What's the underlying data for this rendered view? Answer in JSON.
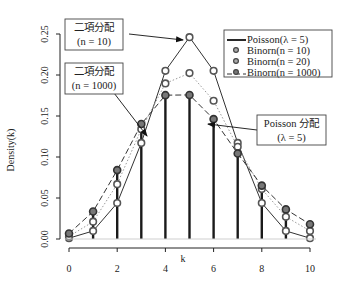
{
  "chart_data": {
    "type": "line",
    "title": "",
    "xlabel": "k",
    "ylabel": "Density(k)",
    "xlim": [
      0,
      10
    ],
    "ylim": [
      0,
      0.25
    ],
    "x_ticks": [
      "0",
      "2",
      "4",
      "6",
      "8",
      "10"
    ],
    "y_ticks": [
      "0.00",
      "0.05",
      "0.10",
      "0.15",
      "0.20",
      "0.25"
    ],
    "grid": false,
    "legend_position": "top-right",
    "x": [
      0,
      1,
      2,
      3,
      4,
      5,
      6,
      7,
      8,
      9,
      10
    ],
    "series": [
      {
        "name": "Poisson(λ = 5)",
        "style": "vertical bars (thick lines)",
        "values": [
          0.0067,
          0.0337,
          0.0842,
          0.1404,
          0.1755,
          0.1755,
          0.1462,
          0.1044,
          0.0653,
          0.0363,
          0.0181
        ]
      },
      {
        "name": "Binorn(n = 10)",
        "style": "points + solid line",
        "values": [
          0.001,
          0.0098,
          0.0439,
          0.1172,
          0.2051,
          0.2461,
          0.2051,
          0.1172,
          0.0439,
          0.0098,
          0.001
        ]
      },
      {
        "name": "Binorn(n = 20)",
        "style": "points + dotted line",
        "values": [
          0.0032,
          0.0211,
          0.0669,
          0.1339,
          0.1897,
          0.2023,
          0.1686,
          0.1124,
          0.0609,
          0.0271,
          0.0099
        ]
      },
      {
        "name": "Binorn(n = 1000)",
        "style": "points + dashed line",
        "values": [
          0.0067,
          0.0335,
          0.084,
          0.1402,
          0.1754,
          0.1757,
          0.1462,
          0.1043,
          0.0651,
          0.0361,
          0.018
        ]
      }
    ],
    "legend": [
      "Poisson(λ = 5)",
      "Binorn(n = 10)",
      "Binorn(n = 20)",
      "Binorn(n = 1000)"
    ],
    "annotations": [
      {
        "line1": "二項分配",
        "line2": "(n = 10)",
        "points_to": {
          "k": 5,
          "series": "Binorn(n = 10)"
        }
      },
      {
        "line1": "二項分配",
        "line2": "(n = 1000)",
        "points_to": {
          "k": 3.4,
          "series": "Binorn(n = 1000)"
        }
      },
      {
        "line1": "Poisson 分配",
        "line2": "(λ = 5)",
        "points_to": {
          "k": 6,
          "series": "Poisson(λ = 5)"
        }
      }
    ]
  },
  "colors": {
    "axis": "#222222",
    "bars": "#1a1a1a",
    "marker_fill": "#8a8a8a",
    "marker_stroke": "#444444",
    "line_n10": "#333333",
    "line_n20": "#9a9a9a",
    "line_n1000": "#333333"
  }
}
